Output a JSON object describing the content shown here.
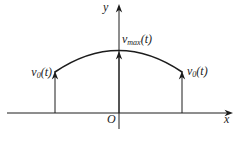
{
  "figure": {
    "background": "#ffffff",
    "line_color": "#1c1c1c",
    "labels": {
      "y_axis": "y",
      "x_axis": "x",
      "origin": "O",
      "left_velocity": {
        "base": "v",
        "sub": "0",
        "args": "(t)"
      },
      "max_velocity": {
        "base": "v",
        "sub": "max",
        "args": "(t)"
      },
      "right_velocity": {
        "base": "v",
        "sub": "0",
        "args": "(t)"
      }
    }
  }
}
